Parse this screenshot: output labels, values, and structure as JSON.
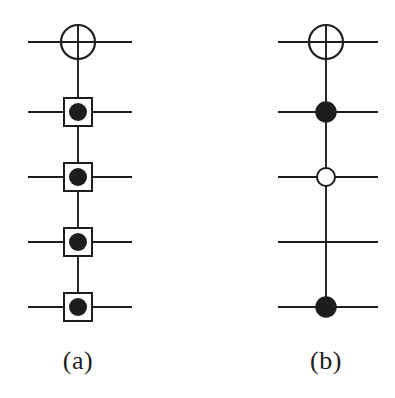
{
  "figure": {
    "kind": "quantum-circuit-diagram",
    "width": 395,
    "height": 398,
    "background_color": "#ffffff",
    "ink_color": "#1d1d1d",
    "panels": [
      {
        "id": "a",
        "caption": "(a)",
        "wire_count": 5,
        "wire_x_start": 28,
        "wire_x_end": 132,
        "vertical_line_x": 78,
        "wire_y": [
          42,
          112,
          177,
          242,
          307
        ],
        "gates": [
          {
            "wire_index": 0,
            "type": "xor-target-circle",
            "radius": 17,
            "fill": "none",
            "stroke": "#1d1d1d",
            "stroke_width": 2.2,
            "cross": true
          },
          {
            "wire_index": 1,
            "type": "boxed-control-dot",
            "box_size": 28,
            "dot_radius": 9,
            "fill": "#1d1d1d",
            "stroke": "#1d1d1d",
            "stroke_width": 2
          },
          {
            "wire_index": 2,
            "type": "boxed-control-dot",
            "box_size": 28,
            "dot_radius": 9,
            "fill": "#1d1d1d",
            "stroke": "#1d1d1d",
            "stroke_width": 2
          },
          {
            "wire_index": 3,
            "type": "boxed-control-dot",
            "box_size": 28,
            "dot_radius": 9,
            "fill": "#1d1d1d",
            "stroke": "#1d1d1d",
            "stroke_width": 2
          },
          {
            "wire_index": 4,
            "type": "boxed-control-dot",
            "box_size": 28,
            "dot_radius": 9,
            "fill": "#1d1d1d",
            "stroke": "#1d1d1d",
            "stroke_width": 2
          }
        ]
      },
      {
        "id": "b",
        "caption": "(b)",
        "wire_count": 5,
        "wire_x_start": 278,
        "wire_x_end": 378,
        "vertical_line_x": 326,
        "wire_y": [
          42,
          112,
          177,
          242,
          307
        ],
        "gates": [
          {
            "wire_index": 0,
            "type": "xor-target-circle",
            "radius": 17,
            "fill": "none",
            "stroke": "#1d1d1d",
            "stroke_width": 2.2,
            "cross": true
          },
          {
            "wire_index": 1,
            "type": "filled-control-dot",
            "dot_radius": 10,
            "fill": "#1d1d1d",
            "stroke": "#1d1d1d",
            "stroke_width": 1.5
          },
          {
            "wire_index": 2,
            "type": "open-control-dot",
            "dot_radius": 9,
            "fill": "#ffffff",
            "stroke": "#1d1d1d",
            "stroke_width": 2
          },
          {
            "wire_index": 3,
            "type": "none",
            "note": "vertical line crosses this wire with no marker"
          },
          {
            "wire_index": 4,
            "type": "filled-control-dot",
            "dot_radius": 10,
            "fill": "#1d1d1d",
            "stroke": "#1d1d1d",
            "stroke_width": 1.5
          }
        ]
      }
    ]
  },
  "captions": {
    "panel_a": "(a)",
    "panel_b": "(b)"
  }
}
